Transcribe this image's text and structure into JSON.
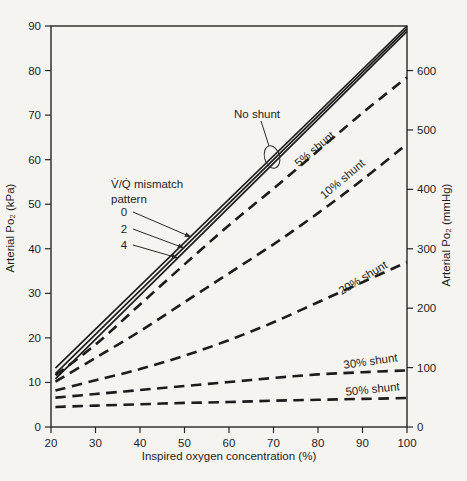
{
  "figure": {
    "background": "#f6f4f1",
    "ink_color": "#1c1c1c",
    "text_color": "#1e1e1e"
  },
  "chart_data": {
    "type": "line",
    "title": "",
    "xlabel": "Inspired oxygen concentration (%)",
    "ylabel_left": "Arterial Po₂ (kPa)",
    "ylabel_right": "Arterial Po₂ (mmHg)",
    "xlim": [
      20,
      100
    ],
    "ylim_kpa": [
      0,
      90
    ],
    "ylim_mmhg": [
      0,
      675
    ],
    "grid": false,
    "x_ticks": [
      20,
      30,
      40,
      50,
      60,
      70,
      80,
      90,
      100
    ],
    "y_ticks_left_kpa": [
      0,
      10,
      20,
      30,
      40,
      50,
      60,
      70,
      80,
      90
    ],
    "y_ticks_right_mmhg": [
      0,
      100,
      200,
      300,
      400,
      500,
      600
    ],
    "series": [
      {
        "name": "vq-pattern-0",
        "label": "0",
        "style": "solid",
        "points": [
          [
            21,
            13.2
          ],
          [
            100,
            90.0
          ]
        ]
      },
      {
        "name": "vq-pattern-2",
        "label": "2",
        "style": "solid",
        "points": [
          [
            21,
            12.0
          ],
          [
            100,
            89.4
          ]
        ]
      },
      {
        "name": "vq-pattern-4",
        "label": "4",
        "style": "solid",
        "points": [
          [
            21,
            10.8
          ],
          [
            100,
            88.8
          ]
        ]
      },
      {
        "name": "shunt-5",
        "label": "5% shunt",
        "style": "dashed",
        "points": [
          [
            21,
            11.6
          ],
          [
            30,
            18.5
          ],
          [
            40,
            27.5
          ],
          [
            50,
            36.5
          ],
          [
            60,
            45.3
          ],
          [
            70,
            53.5
          ],
          [
            80,
            62
          ],
          [
            90,
            70.5
          ],
          [
            100,
            78.5
          ]
        ]
      },
      {
        "name": "shunt-10",
        "label": "10% shunt",
        "style": "dashed",
        "points": [
          [
            21,
            10.2
          ],
          [
            30,
            15.5
          ],
          [
            40,
            21.5
          ],
          [
            50,
            28
          ],
          [
            60,
            34.5
          ],
          [
            70,
            41
          ],
          [
            80,
            48
          ],
          [
            90,
            55.5
          ],
          [
            100,
            63.5
          ]
        ]
      },
      {
        "name": "shunt-20",
        "label": "20% shunt",
        "style": "dashed",
        "points": [
          [
            21,
            8.2
          ],
          [
            30,
            10.5
          ],
          [
            40,
            13
          ],
          [
            50,
            16
          ],
          [
            60,
            19.5
          ],
          [
            70,
            23.5
          ],
          [
            80,
            28
          ],
          [
            90,
            32.5
          ],
          [
            100,
            37
          ]
        ]
      },
      {
        "name": "shunt-30",
        "label": "30% shunt",
        "style": "dashed",
        "points": [
          [
            21,
            6.6
          ],
          [
            30,
            7.4
          ],
          [
            40,
            8.3
          ],
          [
            50,
            9.2
          ],
          [
            60,
            10.1
          ],
          [
            70,
            11
          ],
          [
            80,
            11.8
          ],
          [
            90,
            12.3
          ],
          [
            100,
            12.7
          ]
        ]
      },
      {
        "name": "shunt-50",
        "label": "50% shunt",
        "style": "dashed",
        "points": [
          [
            21,
            4.5
          ],
          [
            30,
            4.8
          ],
          [
            40,
            5.1
          ],
          [
            50,
            5.4
          ],
          [
            60,
            5.6
          ],
          [
            70,
            5.9
          ],
          [
            80,
            6.1
          ],
          [
            90,
            6.3
          ],
          [
            100,
            6.5
          ]
        ]
      }
    ],
    "annotations": {
      "no_shunt": {
        "label": "No shunt",
        "x": 257,
        "y": 114,
        "leader": [
          261,
          121,
          269,
          146
        ],
        "ellipse": {
          "cx": 272,
          "cy": 157,
          "rx": 7.5,
          "ry": 11.5,
          "rot": -15
        }
      },
      "vq_block": {
        "lines": [
          "V̇/Q̇ mismatch",
          "pattern"
        ],
        "x": 111,
        "y": 188,
        "line_h": 15,
        "items": [
          {
            "label": "0",
            "lx": 124,
            "ly": 212,
            "ax": 191,
            "ay": 237
          },
          {
            "label": "2",
            "lx": 124,
            "ly": 229,
            "ax": 184,
            "ay": 248
          },
          {
            "label": "4",
            "lx": 124,
            "ly": 245,
            "ax": 178,
            "ay": 258
          }
        ]
      },
      "shunt_labels": [
        {
          "text": "5% shunt",
          "x": 317,
          "y": 152,
          "rot": -40
        },
        {
          "text": "10% shunt",
          "x": 345,
          "y": 182,
          "rot": -40
        },
        {
          "text": "20% shunt",
          "x": 365,
          "y": 281,
          "rot": -31
        },
        {
          "text": "30% shunt",
          "x": 371,
          "y": 365,
          "rot": -8
        },
        {
          "text": "50% shunt",
          "x": 373,
          "y": 393,
          "rot": -6
        }
      ]
    }
  }
}
